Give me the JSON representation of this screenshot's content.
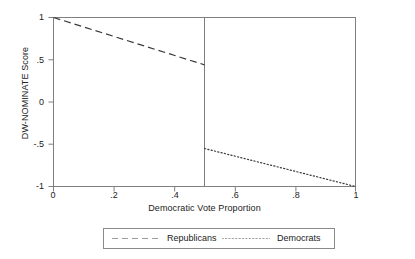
{
  "chart_data": {
    "type": "line",
    "title": "",
    "xlabel": "Democratic Vote Proportion",
    "ylabel": "DW-NOMINATE Score",
    "xlim": [
      0,
      1
    ],
    "ylim": [
      -1,
      1
    ],
    "xticks": [
      "0",
      ".2",
      ".4",
      ".6",
      ".8",
      "1"
    ],
    "xtick_values": [
      0,
      0.2,
      0.4,
      0.6,
      0.8,
      1
    ],
    "yticks": [
      "1",
      ".5",
      "0",
      "-.5",
      "-1"
    ],
    "ytick_values": [
      1,
      0.5,
      0,
      -0.5,
      -1
    ],
    "grid": false,
    "frame": "box",
    "legend_position": "below-axis",
    "annotations": [
      {
        "name": "regression-discontinuity-cutoff",
        "type": "vline",
        "x": 0.5
      }
    ],
    "series": [
      {
        "name": "Republicans",
        "style": "dashed",
        "color": "#3a3a3a",
        "x": [
          0,
          0.5
        ],
        "y": [
          1.0,
          0.44
        ]
      },
      {
        "name": "Democrats",
        "style": "dotted",
        "color": "#3a3a3a",
        "x": [
          0.5,
          1.0
        ],
        "y": [
          -0.55,
          -1.0
        ]
      }
    ]
  },
  "legend": {
    "entries": [
      {
        "label": "Republicans",
        "style": "dashed"
      },
      {
        "label": "Democrats",
        "style": "dotted"
      }
    ]
  }
}
